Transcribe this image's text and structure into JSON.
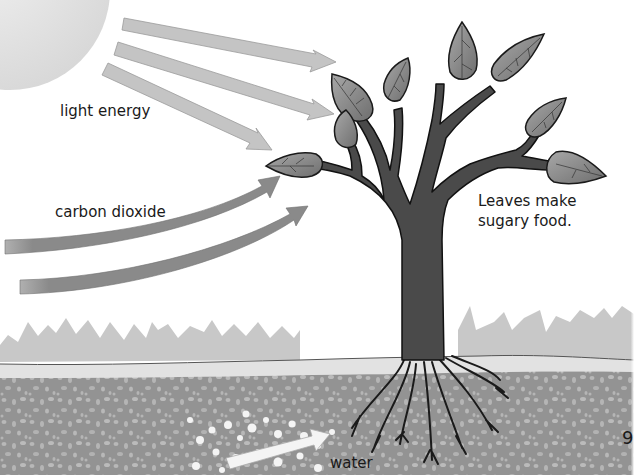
{
  "diagram": {
    "labels": {
      "light_energy": "light energy",
      "carbon_dioxide": "carbon dioxide",
      "leaves_food": "Leaves make sugary food.",
      "water": "water"
    },
    "page_number_fragment": "9",
    "elements": {
      "sun": "sun (partial, top-left)",
      "light_arrows": 3,
      "co2_arrows": 2,
      "water_arrows": 1,
      "leaves": 9
    },
    "colors": {
      "background": "#ffffff",
      "sun": "#e4e4e4",
      "light_arrow": "#c4c4c4",
      "co2_arrow": "#8a8a8a",
      "trunk": "#4a4a4a",
      "leaf": "#8c8c8c",
      "grass": "#c8c8c8",
      "topsoil": "#e2e2e2",
      "soil": "#939393",
      "water_arrow": "#f4f4f4"
    }
  }
}
